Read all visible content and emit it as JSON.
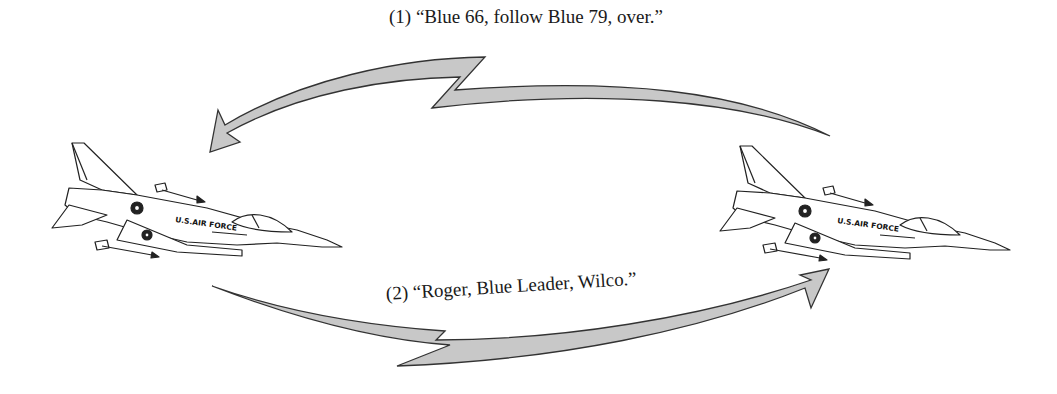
{
  "diagram": {
    "messages": [
      {
        "id": 1,
        "text": "(1) “Blue 66, follow Blue 79, over.”",
        "direction": "right-to-left"
      },
      {
        "id": 2,
        "text": "(2) “Roger, Blue Leader, Wilco.”",
        "direction": "left-to-right"
      }
    ],
    "aircraft": [
      {
        "position": "left",
        "marking": "U.S.AIR FORCE"
      },
      {
        "position": "right",
        "marking": "U.S.AIR FORCE"
      }
    ],
    "colors": {
      "arrow_fill": "#c8c8c8",
      "stroke": "#333333"
    }
  }
}
